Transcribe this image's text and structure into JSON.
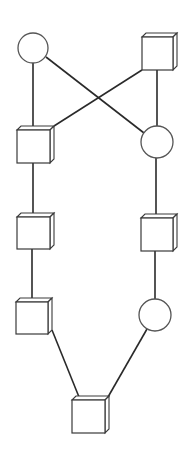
{
  "diagram": {
    "type": "network-topology",
    "width": 189,
    "height": 454,
    "colors": {
      "background": "#ffffff",
      "edge": "#2a2a2a",
      "node_stroke": "#555555"
    },
    "cube_depth": 4,
    "nodes": [
      {
        "id": "circle-top-left",
        "shape": "circle",
        "cx": 33,
        "cy": 48,
        "r": 15
      },
      {
        "id": "cube-top-right",
        "shape": "cube",
        "x": 142,
        "y": 37,
        "w": 31,
        "h": 33
      },
      {
        "id": "cube-left-1",
        "shape": "cube",
        "x": 17,
        "y": 130,
        "w": 33,
        "h": 33
      },
      {
        "id": "circle-right-1",
        "shape": "circle",
        "cx": 157,
        "cy": 142,
        "r": 16
      },
      {
        "id": "cube-left-2",
        "shape": "cube",
        "x": 17,
        "y": 217,
        "w": 33,
        "h": 32
      },
      {
        "id": "cube-right-2",
        "shape": "cube",
        "x": 141,
        "y": 218,
        "w": 32,
        "h": 33
      },
      {
        "id": "cube-left-3",
        "shape": "cube",
        "x": 16,
        "y": 302,
        "w": 32,
        "h": 32
      },
      {
        "id": "circle-right-3",
        "shape": "circle",
        "cx": 155,
        "cy": 315,
        "r": 16
      },
      {
        "id": "cube-bottom",
        "shape": "cube",
        "x": 72,
        "y": 400,
        "w": 33,
        "h": 33
      }
    ],
    "edges": [
      {
        "from": "circle-top-left",
        "to": "cube-left-1",
        "x1": 33,
        "y1": 63,
        "x2": 33,
        "y2": 130
      },
      {
        "from": "circle-top-left",
        "to": "circle-right-1",
        "x1": 46,
        "y1": 57,
        "x2": 144,
        "y2": 133
      },
      {
        "from": "cube-top-right",
        "to": "cube-left-1",
        "x1": 142,
        "y1": 70,
        "x2": 54,
        "y2": 126
      },
      {
        "from": "cube-top-right",
        "to": "circle-right-1",
        "x1": 157,
        "y1": 70,
        "x2": 157,
        "y2": 126
      },
      {
        "from": "cube-left-1",
        "to": "cube-left-2",
        "x1": 33,
        "y1": 163,
        "x2": 33,
        "y2": 217
      },
      {
        "from": "circle-right-1",
        "to": "cube-right-2",
        "x1": 156,
        "y1": 158,
        "x2": 156,
        "y2": 218
      },
      {
        "from": "cube-left-2",
        "to": "cube-left-3",
        "x1": 32,
        "y1": 249,
        "x2": 32,
        "y2": 302
      },
      {
        "from": "cube-right-2",
        "to": "circle-right-3",
        "x1": 155,
        "y1": 251,
        "x2": 155,
        "y2": 299
      },
      {
        "from": "cube-left-3",
        "to": "cube-bottom",
        "x1": 52,
        "y1": 330,
        "x2": 79,
        "y2": 397
      },
      {
        "from": "circle-right-3",
        "to": "cube-bottom",
        "x1": 147,
        "y1": 329,
        "x2": 108,
        "y2": 397
      }
    ]
  }
}
